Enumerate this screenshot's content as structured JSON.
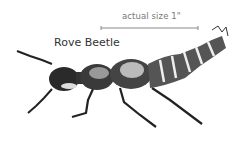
{
  "illustration": {
    "subject": "rove-beetle",
    "title": "Rove Beetle",
    "scale_label": "actual size 1\""
  }
}
